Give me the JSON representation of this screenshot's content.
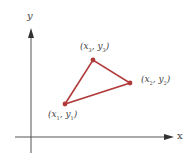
{
  "axes": {
    "x_label": "x",
    "y_label": "y",
    "color": "#555555"
  },
  "triangle": {
    "color": "#b03a3a",
    "vertices": [
      {
        "name": "p1",
        "label_var_x": "x",
        "label_var_y": "y",
        "sub": "1",
        "px": 65,
        "py": 104
      },
      {
        "name": "p2",
        "label_var_x": "x",
        "label_var_y": "y",
        "sub": "2",
        "px": 130,
        "py": 83
      },
      {
        "name": "p3",
        "label_var_x": "x",
        "label_var_y": "y",
        "sub": "3",
        "px": 93,
        "py": 60
      }
    ]
  },
  "labels": {
    "p1": {
      "open": "(",
      "x": "x",
      "sep": ", ",
      "y": "y",
      "close": ")",
      "sub": "1"
    },
    "p2": {
      "open": "(",
      "x": "x",
      "sep": ", ",
      "y": "y",
      "close": ")",
      "sub": "2"
    },
    "p3": {
      "open": "(",
      "x": "x",
      "sep": ", ",
      "y": "y",
      "close": ")",
      "sub": "3"
    }
  }
}
